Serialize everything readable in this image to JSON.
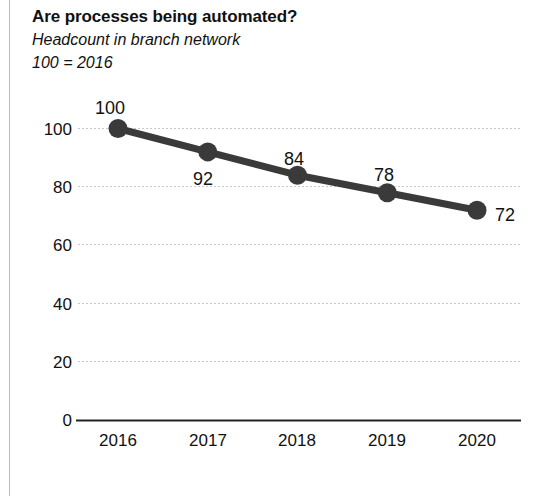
{
  "chart_data": {
    "type": "line",
    "title": "Are processes being automated?",
    "subtitle": "Headcount in branch network",
    "subtitle2": "100 = 2016",
    "xlabel": "",
    "ylabel": "",
    "categories": [
      "2016",
      "2017",
      "2018",
      "2019",
      "2020"
    ],
    "values": [
      100,
      92,
      84,
      78,
      72
    ],
    "point_labels": [
      "100",
      "92",
      "84",
      "78",
      "72"
    ],
    "yticks": [
      "0",
      "20",
      "40",
      "60",
      "80",
      "100"
    ],
    "ylim": [
      0,
      100
    ],
    "grid": true,
    "legend": "none",
    "series": [
      {
        "name": "Headcount index",
        "values": [
          100,
          92,
          84,
          78,
          72
        ]
      }
    ],
    "colors": {
      "line": "#3a3a3a",
      "marker": "#3a3a3a",
      "grid": "#c8c8c8",
      "axis": "#222222",
      "text": "#111111",
      "border": "#b9b9b9"
    }
  }
}
